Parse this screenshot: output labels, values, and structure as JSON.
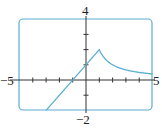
{
  "chart_data": {
    "type": "line",
    "title": "",
    "xlabel": "",
    "ylabel": "",
    "xlim": [
      -5,
      5
    ],
    "ylim": [
      -2,
      4
    ],
    "tick_labels": {
      "x_min": "−5",
      "x_max": "5",
      "y_min": "−2",
      "y_max": "4"
    },
    "x_ticks": [
      -4,
      -3,
      -2,
      -1,
      1,
      2,
      3,
      4
    ],
    "y_ticks": [
      -1,
      1,
      2,
      3
    ],
    "grid": false,
    "series": [
      {
        "name": "f(x)",
        "description": "piecewise: y = x + 1 for x ≤ 1; y = 2/x for x > 1",
        "points": [
          [
            -3,
            -2
          ],
          [
            -1,
            0
          ],
          [
            0,
            1
          ],
          [
            1,
            2
          ],
          [
            1.5,
            1.33
          ],
          [
            2,
            1
          ],
          [
            3,
            0.67
          ],
          [
            4,
            0.5
          ],
          [
            5,
            0.4
          ]
        ]
      }
    ],
    "colors": {
      "curve": "#5aaed0",
      "frame": "#5aaed0",
      "axes": "#333333"
    }
  }
}
